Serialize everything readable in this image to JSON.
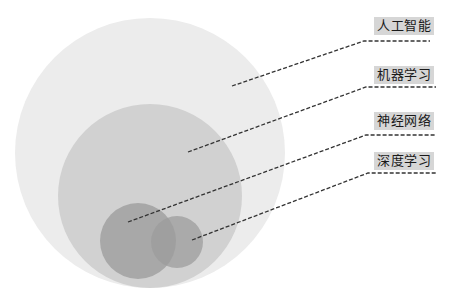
{
  "diagram": {
    "type": "nested-venn",
    "colors": {
      "outer": "#ececec",
      "ml": "#d2d2d2",
      "nn": "#a9a9a9",
      "dl": "#b1b1b1",
      "leader": "#333333",
      "label_bg": "#d6d6d6"
    },
    "circles": [
      {
        "id": "ai",
        "cx": 150,
        "cy": 153,
        "r": 135,
        "fill": "#ececec"
      },
      {
        "id": "ml",
        "cx": 150,
        "cy": 196,
        "r": 92,
        "fill": "#d1d1d1"
      },
      {
        "id": "nn",
        "cx": 138,
        "cy": 241,
        "r": 38,
        "fill": "#a8a8a8"
      },
      {
        "id": "dl",
        "cx": 177,
        "cy": 242,
        "r": 26,
        "fill": "#9c9c9c"
      }
    ],
    "labels": [
      {
        "id": "ai",
        "text": "人工智能",
        "x": 374,
        "y": 17,
        "line": "232,86 364,41 430,41"
      },
      {
        "id": "ml",
        "text": "机器学习",
        "x": 374,
        "y": 66,
        "line": "188,152 366,87 436,87"
      },
      {
        "id": "nn",
        "text": "神经网络",
        "x": 374,
        "y": 112,
        "line": "128,222 366,135 436,135"
      },
      {
        "id": "dl",
        "text": "深度学习",
        "x": 374,
        "y": 152,
        "line": "192,240 368,173 436,173"
      }
    ]
  }
}
